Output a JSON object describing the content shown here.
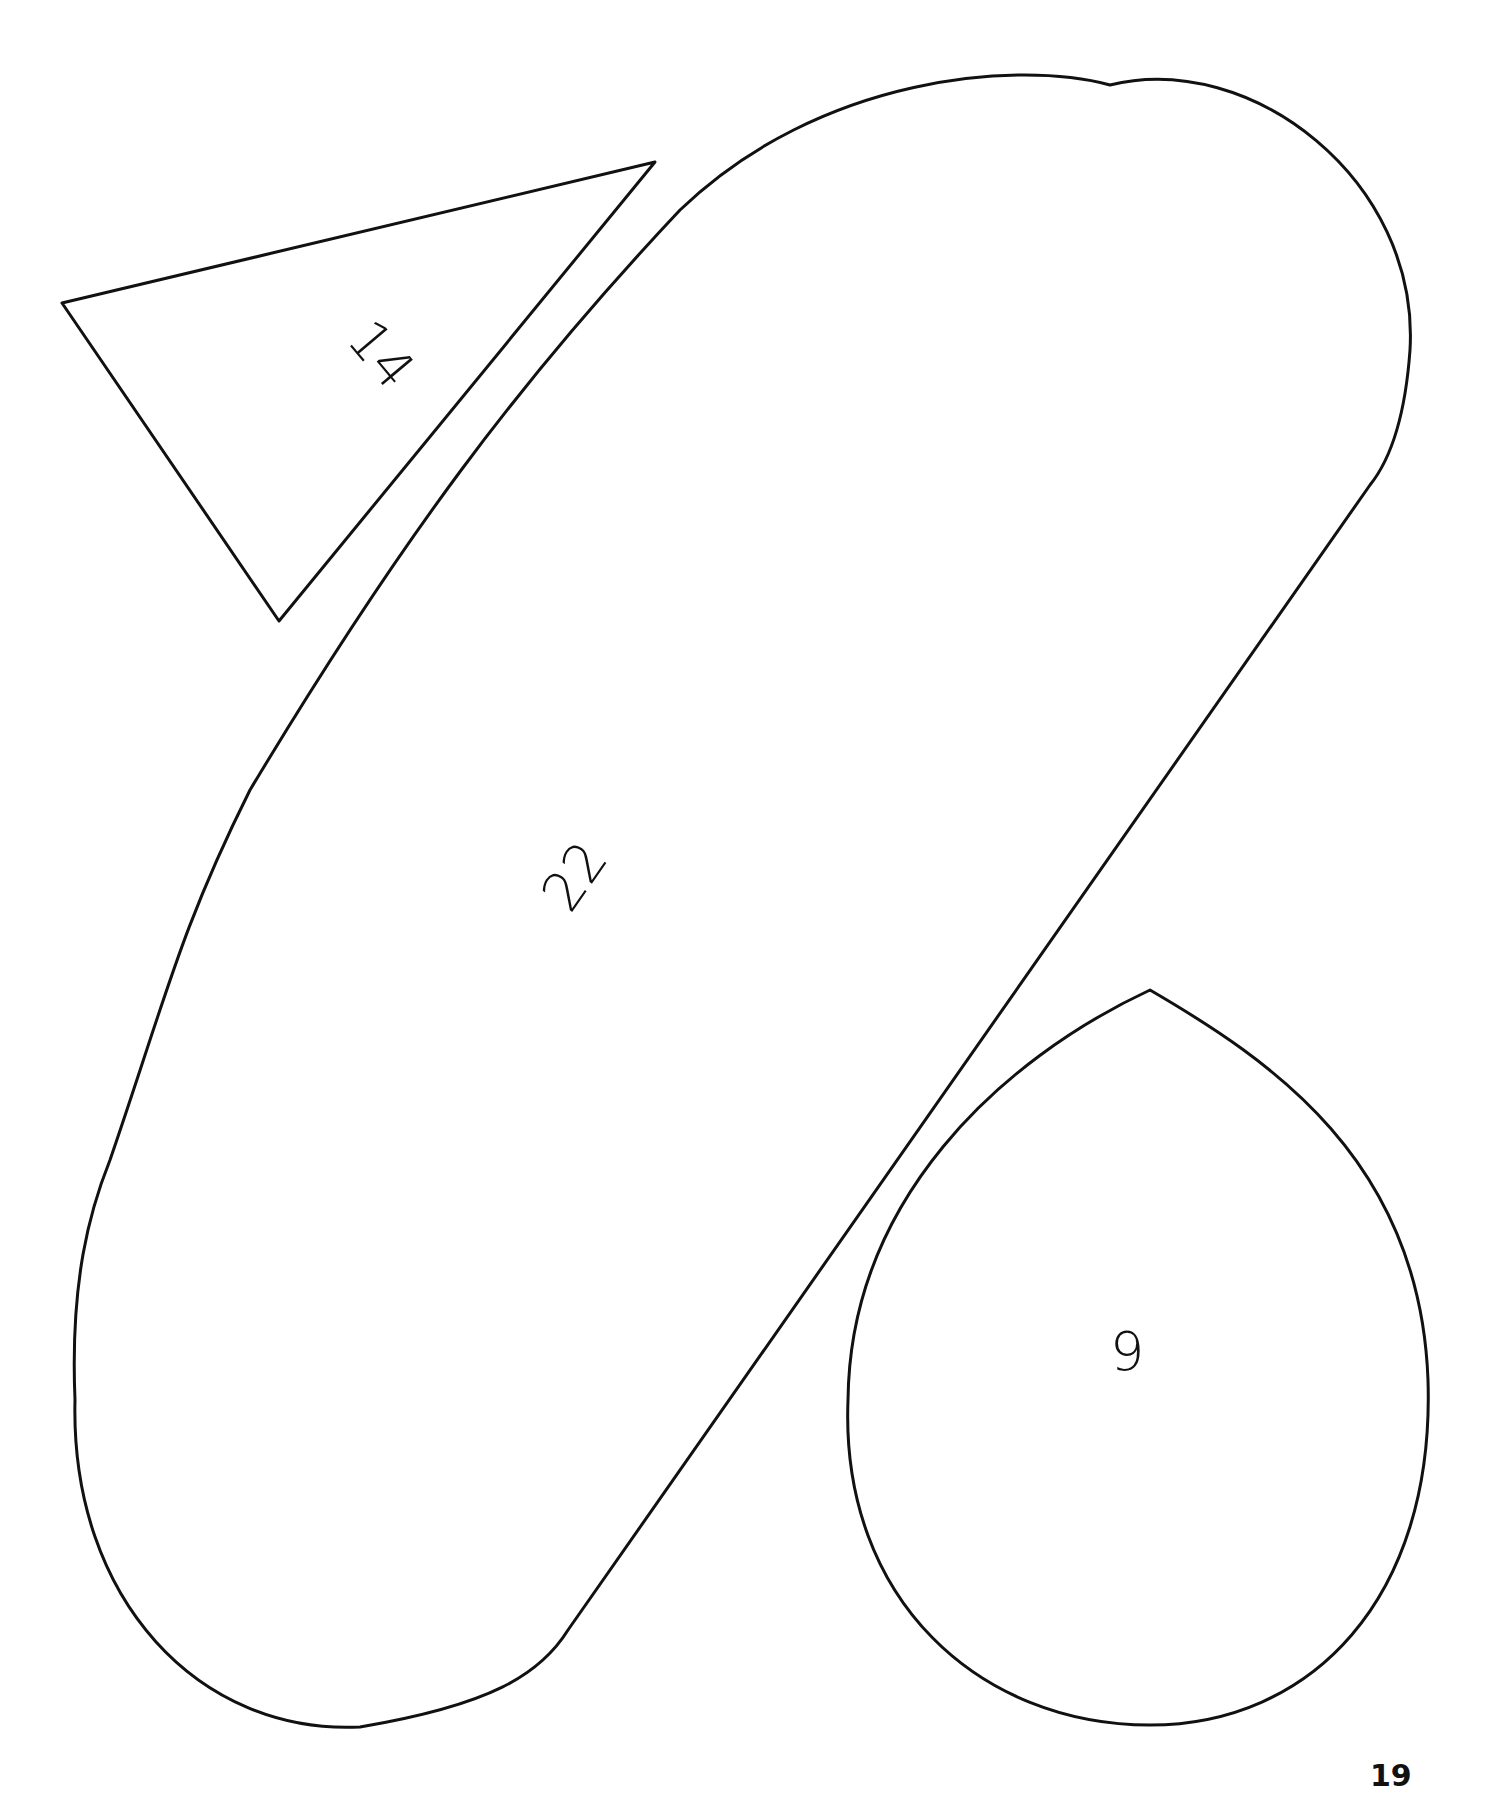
{
  "page": {
    "number": "19",
    "background": "#ffffff",
    "stroke_color": "#111111"
  },
  "shapes": [
    {
      "id": "triangle",
      "label": "14"
    },
    {
      "id": "oblong",
      "label": "22"
    },
    {
      "id": "teardrop",
      "label": "9"
    }
  ]
}
